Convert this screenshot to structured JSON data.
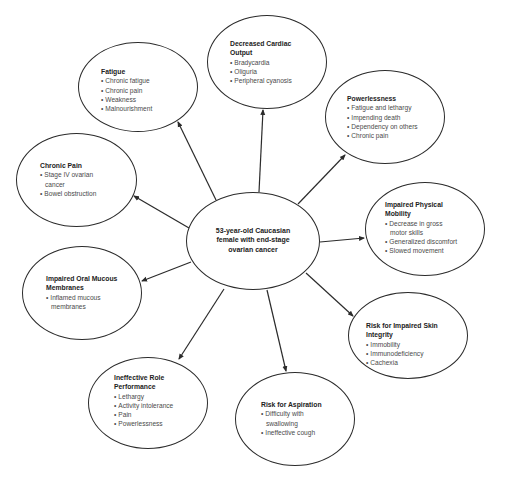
{
  "center": {
    "lines": [
      "53-year-old Caucasian",
      "female with end-stage",
      "ovarian cancer"
    ]
  },
  "nodes": [
    {
      "id": "decreased-cardiac-output",
      "title_lines": [
        "Decreased Cardiac",
        "Output"
      ],
      "items": [
        "Bradycardia",
        "Oliguria",
        "Peripheral cyanosis"
      ]
    },
    {
      "id": "fatigue",
      "title_lines": [
        "Fatigue"
      ],
      "items": [
        "Chronic fatigue",
        "Chronic pain",
        "Weakness",
        "Malnourishment"
      ]
    },
    {
      "id": "powerlessness",
      "title_lines": [
        "Powerlessness"
      ],
      "items": [
        "Fatigue and lethargy",
        "Impending death",
        "Dependency on others",
        "Chronic pain"
      ]
    },
    {
      "id": "chronic-pain",
      "title_lines": [
        "Chronic Pain"
      ],
      "items": [
        "Stage IV ovarian cancer",
        "Bowel obstruction"
      ]
    },
    {
      "id": "impaired-physical-mobility",
      "title_lines": [
        "Impaired Physical",
        "Mobility"
      ],
      "items": [
        "Decrease in gross motor skills",
        "Generalized discomfort",
        "Slowed movement"
      ]
    },
    {
      "id": "impaired-oral-mucous-membranes",
      "title_lines": [
        "Impaired Oral Mucous",
        "Membranes"
      ],
      "items": [
        "Inflamed mucous membranes"
      ]
    },
    {
      "id": "risk-for-impaired-skin-integrity",
      "title_lines": [
        "Risk for Impaired Skin",
        "Integrity"
      ],
      "items": [
        "Immobility",
        "Immunodeficiency",
        "Cachexia"
      ]
    },
    {
      "id": "ineffective-role-performance",
      "title_lines": [
        "Ineffective Role",
        "Performance"
      ],
      "items": [
        "Lethargy",
        "Activity intolerance",
        "Pain",
        "Powerlessness"
      ]
    },
    {
      "id": "risk-for-aspiration",
      "title_lines": [
        "Risk for Aspiration"
      ],
      "items": [
        "Difficulty with swallowing",
        "Ineffective cough"
      ]
    }
  ],
  "colors": {
    "stroke": "#2b2b2b",
    "text": "#4a4a4a",
    "title": "#222222",
    "background": "#ffffff"
  }
}
